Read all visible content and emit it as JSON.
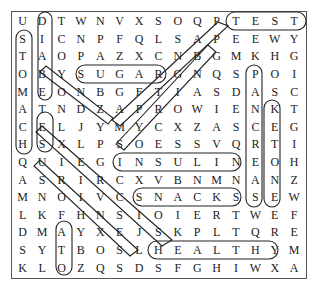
{
  "puzzle": {
    "rows": [
      [
        "U",
        "D",
        "T",
        "W",
        "N",
        "V",
        "X",
        "S",
        "O",
        "Q",
        "P",
        "T",
        "E",
        "S",
        "T"
      ],
      [
        "S",
        "I",
        "C",
        "N",
        "P",
        "F",
        "Q",
        "L",
        "S",
        "A",
        "P",
        "E",
        "E",
        "W",
        "Y"
      ],
      [
        "T",
        "A",
        "O",
        "P",
        "A",
        "Z",
        "X",
        "C",
        "N",
        "B",
        "G",
        "M",
        "K",
        "H",
        "G"
      ],
      [
        "O",
        "B",
        "Y",
        "S",
        "U",
        "G",
        "A",
        "R",
        "G",
        "N",
        "Q",
        "S",
        "P",
        "O",
        "I"
      ],
      [
        "M",
        "E",
        "O",
        "N",
        "B",
        "G",
        "F",
        "T",
        "I",
        "A",
        "S",
        "D",
        "A",
        "S",
        "C"
      ],
      [
        "A",
        "T",
        "N",
        "D",
        "Z",
        "A",
        "P",
        "R",
        "O",
        "W",
        "I",
        "E",
        "N",
        "K",
        "T"
      ],
      [
        "C",
        "E",
        "L",
        "J",
        "Y",
        "M",
        "Y",
        "C",
        "X",
        "Z",
        "A",
        "S",
        "C",
        "E",
        "G"
      ],
      [
        "H",
        "S",
        "X",
        "L",
        "P",
        "S",
        "O",
        "E",
        "S",
        "S",
        "V",
        "Q",
        "R",
        "T",
        "I"
      ],
      [
        "Q",
        "U",
        "I",
        "E",
        "G",
        "I",
        "N",
        "S",
        "U",
        "L",
        "I",
        "N",
        "E",
        "O",
        "H"
      ],
      [
        "A",
        "S",
        "R",
        "I",
        "R",
        "C",
        "X",
        "V",
        "B",
        "N",
        "M",
        "N",
        "A",
        "N",
        "Z"
      ],
      [
        "M",
        "N",
        "O",
        "I",
        "V",
        "C",
        "S",
        "N",
        "A",
        "C",
        "K",
        "S",
        "S",
        "E",
        "W"
      ],
      [
        "L",
        "K",
        "F",
        "H",
        "N",
        "S",
        "I",
        "O",
        "I",
        "E",
        "R",
        "T",
        "W",
        "E",
        "F"
      ],
      [
        "D",
        "M",
        "A",
        "Y",
        "X",
        "E",
        "J",
        "S",
        "K",
        "P",
        "L",
        "T",
        "Q",
        "R",
        "E"
      ],
      [
        "S",
        "Y",
        "T",
        "B",
        "O",
        "S",
        "L",
        "H",
        "E",
        "A",
        "L",
        "T",
        "H",
        "Y",
        "M"
      ],
      [
        "K",
        "L",
        "O",
        "Z",
        "Q",
        "S",
        "D",
        "S",
        "F",
        "G",
        "H",
        "I",
        "W",
        "X",
        "A"
      ]
    ],
    "found_words": [
      "TEST",
      "SUGAR",
      "INSULIN",
      "SNACKS",
      "HEALTHY",
      "KETONE",
      "PANCREAS",
      "FAT",
      "STOMACH",
      "DIABETES",
      "BODY",
      "EXERCISE",
      "GLUCOSE",
      "VISION"
    ]
  }
}
